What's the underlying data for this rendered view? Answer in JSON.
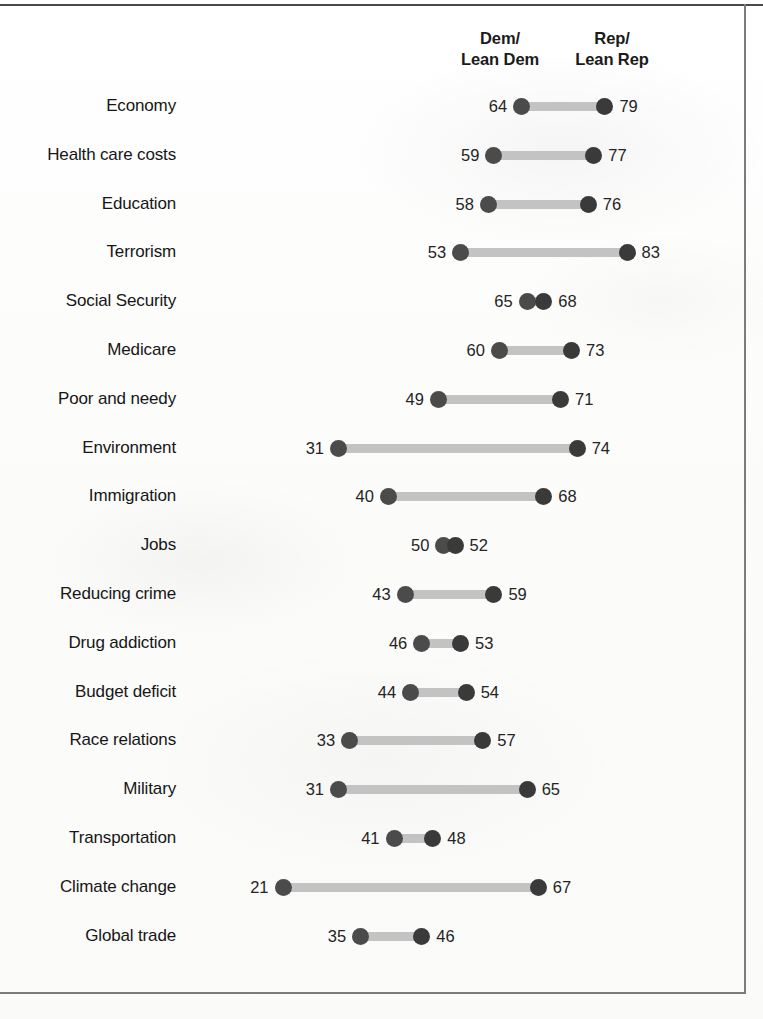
{
  "header": {
    "left_column": "Dem/\nLean Dem",
    "right_column": "Rep/\nLean Rep",
    "left_column_line1": "Dem/",
    "left_column_line2": "Lean Dem",
    "right_column_line1": "Rep/",
    "right_column_line2": "Lean Rep"
  },
  "colors": {
    "dem_dot": "#4b4b4b",
    "rep_dot": "#3a3a3a",
    "connector": "#c3c3c3",
    "text": "#161616",
    "rule": "#4a4a4a"
  },
  "chart_data": {
    "type": "bar",
    "subtype": "dumbbell-dot-plot",
    "title": "",
    "xlabel": "",
    "ylabel": "",
    "xlim": [
      21,
      83
    ],
    "grid": false,
    "legend_position": "top",
    "categories": [
      "Economy",
      "Health care costs",
      "Education",
      "Terrorism",
      "Social Security",
      "Medicare",
      "Poor and needy",
      "Environment",
      "Immigration",
      "Jobs",
      "Reducing crime",
      "Drug addiction",
      "Budget deficit",
      "Race relations",
      "Military",
      "Transportation",
      "Climate change",
      "Global trade"
    ],
    "series": [
      {
        "name": "Dem/Lean Dem",
        "values": [
          64,
          59,
          58,
          53,
          65,
          60,
          49,
          31,
          40,
          50,
          43,
          46,
          44,
          33,
          31,
          41,
          21,
          35
        ]
      },
      {
        "name": "Rep/Lean Rep",
        "values": [
          79,
          77,
          76,
          83,
          68,
          73,
          71,
          74,
          68,
          52,
          59,
          53,
          54,
          57,
          65,
          48,
          67,
          46
        ]
      }
    ],
    "rows": [
      {
        "label": "Economy",
        "dem": 64,
        "rep": 79
      },
      {
        "label": "Health care costs",
        "dem": 59,
        "rep": 77
      },
      {
        "label": "Education",
        "dem": 58,
        "rep": 76
      },
      {
        "label": "Terrorism",
        "dem": 53,
        "rep": 83
      },
      {
        "label": "Social Security",
        "dem": 65,
        "rep": 68
      },
      {
        "label": "Medicare",
        "dem": 60,
        "rep": 73
      },
      {
        "label": "Poor and needy",
        "dem": 49,
        "rep": 71
      },
      {
        "label": "Environment",
        "dem": 31,
        "rep": 74
      },
      {
        "label": "Immigration",
        "dem": 40,
        "rep": 68
      },
      {
        "label": "Jobs",
        "dem": 50,
        "rep": 52
      },
      {
        "label": "Reducing crime",
        "dem": 43,
        "rep": 59
      },
      {
        "label": "Drug addiction",
        "dem": 46,
        "rep": 53
      },
      {
        "label": "Budget deficit",
        "dem": 44,
        "rep": 54
      },
      {
        "label": "Race relations",
        "dem": 33,
        "rep": 57
      },
      {
        "label": "Military",
        "dem": 31,
        "rep": 65
      },
      {
        "label": "Transportation",
        "dem": 41,
        "rep": 48
      },
      {
        "label": "Climate change",
        "dem": 21,
        "rep": 67
      },
      {
        "label": "Global trade",
        "dem": 35,
        "rep": 46
      }
    ]
  },
  "layout": {
    "first_row_y": 90,
    "row_step": 48.8,
    "x_origin_px": 283,
    "px_per_unit": 5.55,
    "value_origin": 21
  }
}
